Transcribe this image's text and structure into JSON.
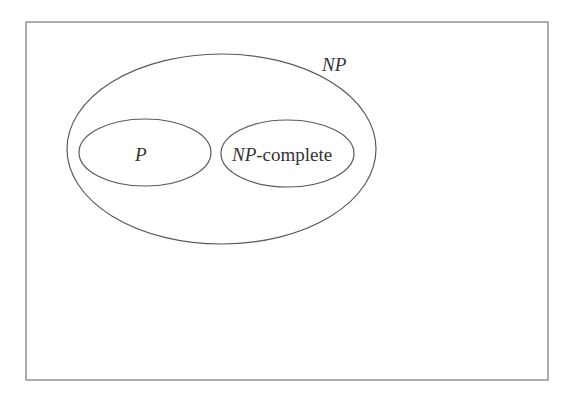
{
  "diagram": {
    "type": "venn",
    "title": "",
    "sets": [
      {
        "id": "np",
        "label": "NP",
        "italic": true
      },
      {
        "id": "p",
        "label": "P",
        "italic": true,
        "parent": "np"
      },
      {
        "id": "npc",
        "label_italic_part": "NP",
        "label_suffix": "-complete",
        "parent": "np"
      }
    ],
    "labels": {
      "np": "NP",
      "p": "P",
      "npc_prefix": "NP",
      "npc_suffix": "-complete"
    },
    "colors": {
      "frame": "#8a8a8a",
      "outline": "#5a5a5a",
      "text": "#333333",
      "background": "#ffffff"
    }
  }
}
